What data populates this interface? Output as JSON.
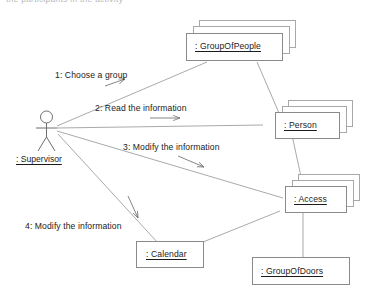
{
  "diagram": {
    "type": "uml-collaboration-diagram",
    "clipped_top_text": "the participants in the activity",
    "actor": {
      "name": "actor-supervisor",
      "label": ": Supervisor",
      "icon": "stick-figure-actor-icon"
    },
    "objects": [
      {
        "id": "groupofpeople",
        "label": ": GroupOfPeople",
        "multiplicity": "multi-object",
        "stack": 3
      },
      {
        "id": "person",
        "label": ": Person",
        "multiplicity": "multi-object",
        "stack": 3
      },
      {
        "id": "access",
        "label": ": Access",
        "multiplicity": "multi-object",
        "stack": 3
      },
      {
        "id": "calendar",
        "label": ": Calendar",
        "multiplicity": "single-object",
        "stack": 1
      },
      {
        "id": "groupofdoors",
        "label": ": GroupOfDoors",
        "multiplicity": "single-object",
        "stack": 1
      }
    ],
    "messages": [
      {
        "seq": "1",
        "label": "1: Choose a group",
        "from": "actor-supervisor",
        "to": "groupofpeople",
        "direction": "up-right"
      },
      {
        "seq": "2",
        "label": "2: Read the information",
        "from": "actor-supervisor",
        "to": "person",
        "direction": "right"
      },
      {
        "seq": "3",
        "label": "3: Modify the information",
        "from": "actor-supervisor",
        "to": "access",
        "direction": "down-right"
      },
      {
        "seq": "4",
        "label": "4: Modify the information",
        "from": "actor-supervisor",
        "to": "calendar",
        "direction": "down"
      }
    ],
    "links": [
      {
        "from": "actor-supervisor",
        "to": "groupofpeople"
      },
      {
        "from": "actor-supervisor",
        "to": "person"
      },
      {
        "from": "actor-supervisor",
        "to": "access"
      },
      {
        "from": "actor-supervisor",
        "to": "calendar"
      },
      {
        "from": "groupofpeople",
        "to": "person"
      },
      {
        "from": "person",
        "to": "access"
      },
      {
        "from": "access",
        "to": "calendar"
      },
      {
        "from": "access",
        "to": "groupofdoors"
      }
    ],
    "colors": {
      "background": "#ffffff",
      "stroke": "#8a8a8a",
      "text": "#1b1b1b"
    }
  }
}
